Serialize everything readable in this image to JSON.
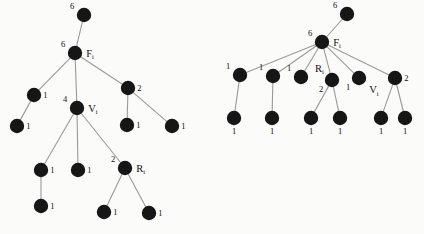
{
  "figure": {
    "background_color": "#fbfbfa",
    "node_color": "#161616",
    "edge_color": "#9a9a96",
    "node_radius": 7.2,
    "trees": [
      {
        "id": "left-tree",
        "name": "left-tree",
        "nodes": [
          {
            "id": "L0",
            "x": 84,
            "y": 15,
            "weight": "6",
            "weight_pos": "left",
            "name": ""
          },
          {
            "id": "L1",
            "x": 75,
            "y": 53,
            "weight": "6",
            "weight_pos": "left",
            "name": "F",
            "sub": "i",
            "name_pos": "right"
          },
          {
            "id": "L2",
            "x": 34,
            "y": 95,
            "weight": "1",
            "weight_pos": "right",
            "name": ""
          },
          {
            "id": "L3",
            "x": 17,
            "y": 126,
            "weight": "1",
            "weight_pos": "right",
            "name": ""
          },
          {
            "id": "L4",
            "x": 77,
            "y": 108,
            "weight": "4",
            "weight_pos": "left",
            "name": "V",
            "sub": "i",
            "name_pos": "right"
          },
          {
            "id": "L5",
            "x": 128,
            "y": 88,
            "weight": "2",
            "weight_pos": "right",
            "name": ""
          },
          {
            "id": "L6",
            "x": 127,
            "y": 125,
            "weight": "1",
            "weight_pos": "right",
            "name": ""
          },
          {
            "id": "L7",
            "x": 172,
            "y": 126,
            "weight": "1",
            "weight_pos": "right",
            "name": ""
          },
          {
            "id": "L8",
            "x": 41,
            "y": 170,
            "weight": "1",
            "weight_pos": "right",
            "name": ""
          },
          {
            "id": "L9",
            "x": 78,
            "y": 170,
            "weight": "1",
            "weight_pos": "right",
            "name": ""
          },
          {
            "id": "L10",
            "x": 41,
            "y": 206,
            "weight": "1",
            "weight_pos": "right",
            "name": ""
          },
          {
            "id": "L11",
            "x": 125,
            "y": 168,
            "weight": "2",
            "weight_pos": "left",
            "name": "R",
            "sub": "i",
            "name_pos": "right"
          },
          {
            "id": "L12",
            "x": 104,
            "y": 212,
            "weight": "1",
            "weight_pos": "right",
            "name": ""
          },
          {
            "id": "L13",
            "x": 149,
            "y": 213,
            "weight": "1",
            "weight_pos": "right",
            "name": ""
          }
        ],
        "edges": [
          [
            "L0",
            "L1"
          ],
          [
            "L1",
            "L2"
          ],
          [
            "L1",
            "L4"
          ],
          [
            "L1",
            "L5"
          ],
          [
            "L2",
            "L3"
          ],
          [
            "L5",
            "L6"
          ],
          [
            "L5",
            "L7"
          ],
          [
            "L4",
            "L8"
          ],
          [
            "L4",
            "L9"
          ],
          [
            "L4",
            "L11"
          ],
          [
            "L8",
            "L10"
          ],
          [
            "L11",
            "L12"
          ],
          [
            "L11",
            "L13"
          ]
        ]
      },
      {
        "id": "right-tree",
        "name": "right-tree",
        "nodes": [
          {
            "id": "R0",
            "x": 347,
            "y": 14,
            "weight": "6",
            "weight_pos": "left",
            "name": ""
          },
          {
            "id": "R1",
            "x": 322,
            "y": 42,
            "weight": "6",
            "weight_pos": "left",
            "name": "F",
            "sub": "i",
            "name_pos": "right"
          },
          {
            "id": "R2",
            "x": 240,
            "y": 75,
            "weight": "1",
            "weight_pos": "left",
            "name": ""
          },
          {
            "id": "R3",
            "x": 273,
            "y": 76,
            "weight": "1",
            "weight_pos": "left",
            "name": ""
          },
          {
            "id": "R4",
            "x": 301,
            "y": 77,
            "weight": "1",
            "weight_pos": "left",
            "name": ""
          },
          {
            "id": "R5",
            "x": 332,
            "y": 80,
            "weight": "2",
            "weight_pos": "belowleft",
            "name": "R",
            "sub": "i",
            "name_pos": "aboveleft"
          },
          {
            "id": "R6",
            "x": 359,
            "y": 78,
            "weight": "1",
            "weight_pos": "belowleft",
            "name": "V",
            "sub": "i",
            "name_pos": "belowright"
          },
          {
            "id": "R7",
            "x": 395,
            "y": 78,
            "weight": "2",
            "weight_pos": "right",
            "name": ""
          },
          {
            "id": "R8",
            "x": 234,
            "y": 118,
            "weight": "1",
            "weight_pos": "below",
            "name": ""
          },
          {
            "id": "R9",
            "x": 272,
            "y": 118,
            "weight": "1",
            "weight_pos": "below",
            "name": ""
          },
          {
            "id": "R10",
            "x": 311,
            "y": 118,
            "weight": "1",
            "weight_pos": "below",
            "name": ""
          },
          {
            "id": "R11",
            "x": 340,
            "y": 118,
            "weight": "1",
            "weight_pos": "below",
            "name": ""
          },
          {
            "id": "R12",
            "x": 381,
            "y": 118,
            "weight": "1",
            "weight_pos": "below",
            "name": ""
          },
          {
            "id": "R13",
            "x": 405,
            "y": 118,
            "weight": "1",
            "weight_pos": "below",
            "name": ""
          }
        ],
        "edges": [
          [
            "R0",
            "R1"
          ],
          [
            "R1",
            "R2"
          ],
          [
            "R1",
            "R3"
          ],
          [
            "R1",
            "R4"
          ],
          [
            "R1",
            "R5"
          ],
          [
            "R1",
            "R6"
          ],
          [
            "R1",
            "R7"
          ],
          [
            "R2",
            "R8"
          ],
          [
            "R3",
            "R9"
          ],
          [
            "R5",
            "R10"
          ],
          [
            "R5",
            "R11"
          ],
          [
            "R7",
            "R12"
          ],
          [
            "R7",
            "R13"
          ]
        ]
      }
    ]
  }
}
